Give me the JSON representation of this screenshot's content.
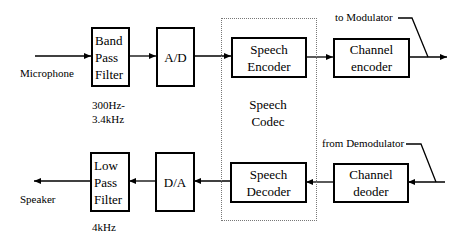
{
  "diagram": {
    "transmit_path": {
      "input_label": "Microphone",
      "blocks": [
        {
          "id": "band-pass-filter",
          "lines": [
            "Band",
            "Pass",
            "Filter"
          ],
          "note": [
            "300Hz-",
            "3.4kHz"
          ]
        },
        {
          "id": "ad-converter",
          "lines": [
            "A/D"
          ]
        },
        {
          "id": "speech-encoder",
          "lines": [
            "Speech",
            "Encoder"
          ]
        },
        {
          "id": "channel-encoder",
          "lines": [
            "Channel",
            "encoder"
          ]
        }
      ],
      "output_label": "to Modulator"
    },
    "receive_path": {
      "input_label": "from Demodulator",
      "blocks": [
        {
          "id": "channel-decoder",
          "lines": [
            "Channel",
            "deoder"
          ]
        },
        {
          "id": "speech-decoder",
          "lines": [
            "Speech",
            "Decoder"
          ]
        },
        {
          "id": "da-converter",
          "lines": [
            "D/A"
          ]
        },
        {
          "id": "low-pass-filter",
          "lines": [
            "Low",
            "Pass",
            "Filter"
          ],
          "note": [
            "4kHz"
          ]
        }
      ],
      "output_label": "Speaker"
    },
    "group": {
      "lines": [
        "Speech",
        "Codec"
      ]
    }
  }
}
